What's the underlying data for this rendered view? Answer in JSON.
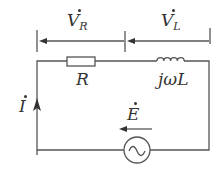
{
  "diagram": {
    "type": "series RL circuit with AC source",
    "labels": {
      "voltage_R": {
        "main": "V",
        "sub": "R"
      },
      "voltage_L": {
        "main": "V",
        "sub": "L"
      },
      "resistor": "R",
      "inductor": "jωL",
      "current": "I",
      "source": "E"
    },
    "colors": {
      "line": "#555555",
      "text": "#333333",
      "background": "#ffffff"
    }
  }
}
